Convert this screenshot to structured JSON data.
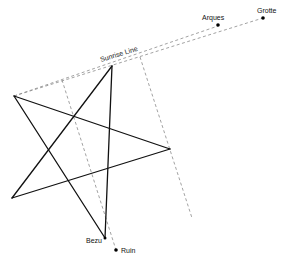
{
  "diagram": {
    "colors": {
      "star": "#111111",
      "dashed": "#888888",
      "point": "#000000",
      "text": "#111111"
    },
    "labels": {
      "sunrise_line": "Sunrise Line",
      "arques": "Arques",
      "grotte": "Grotte",
      "bezu": "Bezu",
      "ruin": "Ruin"
    },
    "points": {
      "arques": {
        "x": 218,
        "y": 25
      },
      "grotte": {
        "x": 263,
        "y": 18
      },
      "bezu": {
        "x": 105,
        "y": 238
      },
      "ruin": {
        "x": 116,
        "y": 250
      }
    },
    "star_vertices": [
      {
        "name": "top",
        "x": 112,
        "y": 66
      },
      {
        "name": "upper-left",
        "x": 14,
        "y": 96
      },
      {
        "name": "right",
        "x": 170,
        "y": 149
      },
      {
        "name": "lower-left",
        "x": 12,
        "y": 198
      },
      {
        "name": "bottom",
        "x": 105,
        "y": 238
      }
    ]
  }
}
